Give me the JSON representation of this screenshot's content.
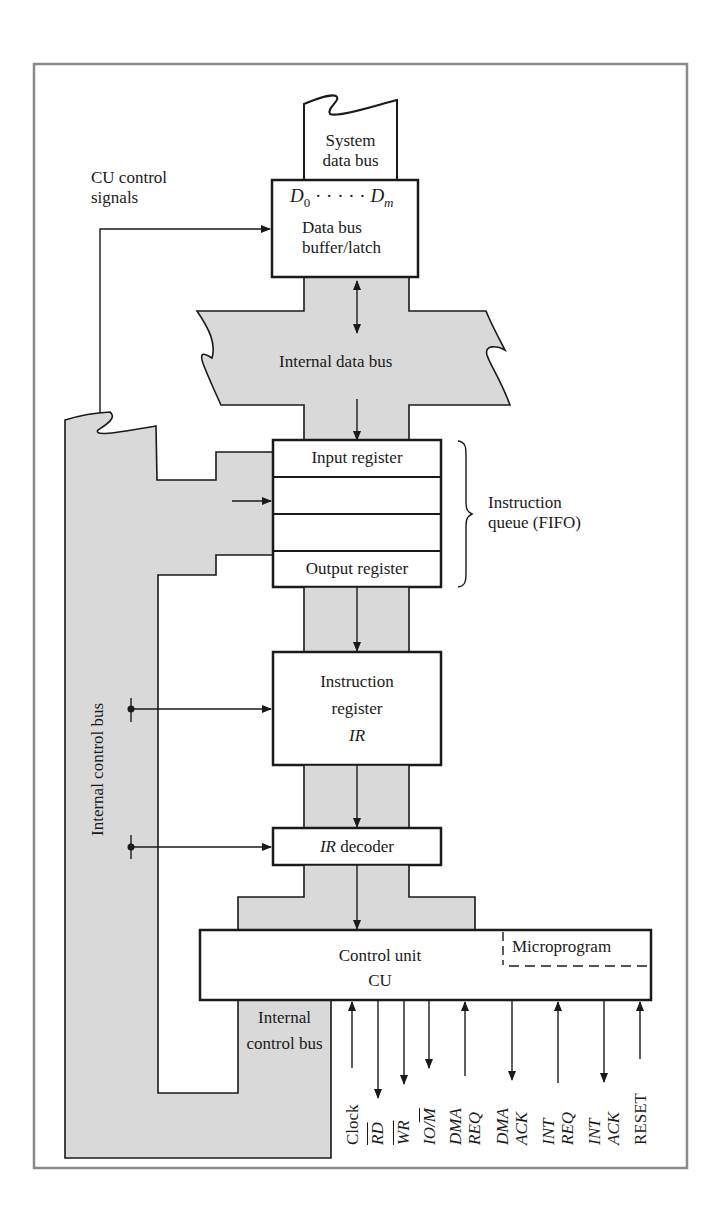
{
  "diagram": {
    "colors": {
      "bus_fill": "#d9d9d9",
      "frame": "#8a8a8a",
      "line": "#1a1a1a",
      "background": "#ffffff"
    },
    "labels": {
      "system_data_bus": [
        "System",
        "data bus"
      ],
      "cu_control_signals": [
        "CU control",
        "signals"
      ],
      "data_bus_range_start": "D",
      "data_bus_range_start_sub": "0",
      "data_bus_range_dots": "· · · · ·",
      "data_bus_range_end": "D",
      "data_bus_range_end_sub": "m",
      "data_bus_buffer": [
        "Data bus",
        "buffer/latch"
      ],
      "internal_data_bus": "Internal data bus",
      "input_register": "Input register",
      "output_register": "Output register",
      "instruction_queue": [
        "Instruction",
        "queue (FIFO)"
      ],
      "instruction_register": [
        "Instruction",
        "register"
      ],
      "instruction_register_abbr": "IR",
      "ir_decoder_abbr": "IR",
      "ir_decoder_text": "decoder",
      "control_unit": [
        "Control unit",
        "CU"
      ],
      "microprogram": "Microprogram",
      "internal_control_bus_vertical": "Internal control bus",
      "internal_control_bus_bottom": [
        "Internal",
        "control bus"
      ]
    },
    "signals": [
      {
        "name": "Clock",
        "line1": "Clock",
        "line2": "",
        "direction": "in",
        "italic": false,
        "overline": ""
      },
      {
        "name": "RD",
        "line1": "RD",
        "line2": "",
        "direction": "out",
        "italic": true,
        "overline": "all"
      },
      {
        "name": "WR",
        "line1": "WR",
        "line2": "",
        "direction": "out",
        "italic": true,
        "overline": "all"
      },
      {
        "name": "IO/M",
        "line1": "IO/M",
        "line2": "",
        "direction": "out",
        "italic": true,
        "overline": "M"
      },
      {
        "name": "DMA REQ",
        "line1": "DMA",
        "line2": "REQ",
        "direction": "in",
        "italic": true,
        "overline": ""
      },
      {
        "name": "DMA ACK",
        "line1": "DMA",
        "line2": "ACK",
        "direction": "out",
        "italic": true,
        "overline": ""
      },
      {
        "name": "INT REQ",
        "line1": "INT",
        "line2": "REQ",
        "direction": "in",
        "italic": true,
        "overline": ""
      },
      {
        "name": "INT ACK",
        "line1": "INT",
        "line2": "ACK",
        "direction": "out",
        "italic": true,
        "overline": ""
      },
      {
        "name": "RESET",
        "line1": "RESET",
        "line2": "",
        "direction": "in",
        "italic": false,
        "overline": ""
      }
    ]
  }
}
